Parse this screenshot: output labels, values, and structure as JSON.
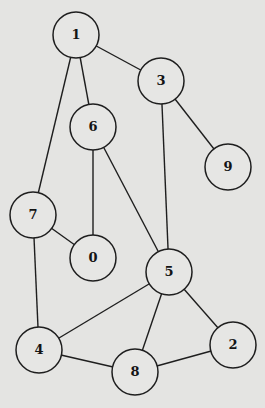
{
  "diagram": {
    "type": "undirected-graph",
    "colors": {
      "background": "#e4e4e2",
      "stroke": "#1e1e1e",
      "label": "#141414"
    },
    "node_radius": 23,
    "nodes": [
      {
        "id": "1",
        "label": "1",
        "x": 76,
        "y": 35
      },
      {
        "id": "3",
        "label": "3",
        "x": 161,
        "y": 81
      },
      {
        "id": "6",
        "label": "6",
        "x": 93,
        "y": 127
      },
      {
        "id": "9",
        "label": "9",
        "x": 228,
        "y": 167
      },
      {
        "id": "7",
        "label": "7",
        "x": 33,
        "y": 215
      },
      {
        "id": "0",
        "label": "0",
        "x": 93,
        "y": 258
      },
      {
        "id": "5",
        "label": "5",
        "x": 169,
        "y": 272
      },
      {
        "id": "4",
        "label": "4",
        "x": 39,
        "y": 350
      },
      {
        "id": "2",
        "label": "2",
        "x": 233,
        "y": 345
      },
      {
        "id": "8",
        "label": "8",
        "x": 135,
        "y": 372
      }
    ],
    "edges": [
      [
        "1",
        "3"
      ],
      [
        "1",
        "6"
      ],
      [
        "1",
        "7"
      ],
      [
        "3",
        "9"
      ],
      [
        "3",
        "5"
      ],
      [
        "6",
        "0"
      ],
      [
        "6",
        "5"
      ],
      [
        "7",
        "0"
      ],
      [
        "7",
        "4"
      ],
      [
        "5",
        "4"
      ],
      [
        "5",
        "8"
      ],
      [
        "5",
        "2"
      ],
      [
        "4",
        "8"
      ],
      [
        "8",
        "2"
      ]
    ]
  }
}
